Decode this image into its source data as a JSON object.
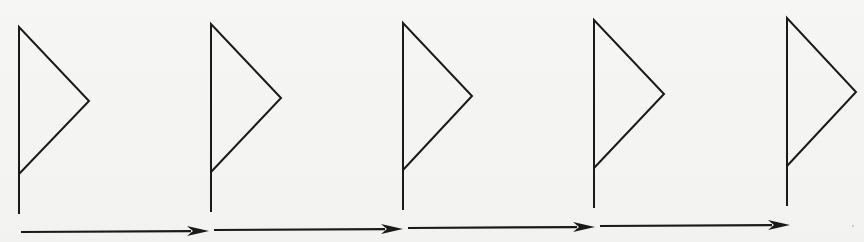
{
  "diagram": {
    "type": "sequence-of-flags",
    "stroke_color": "#1a1a1a",
    "background_color": "#f4f4f2",
    "flags": [
      {
        "id": "flag-1",
        "pole_x": 19,
        "top_y": 27,
        "tip_x": 89,
        "tip_y": 101,
        "junction_y": 174,
        "bottom_y": 214
      },
      {
        "id": "flag-2",
        "pole_x": 211,
        "top_y": 24,
        "tip_x": 281,
        "tip_y": 98,
        "junction_y": 172,
        "bottom_y": 212
      },
      {
        "id": "flag-3",
        "pole_x": 403,
        "top_y": 23,
        "tip_x": 472,
        "tip_y": 96,
        "junction_y": 170,
        "bottom_y": 210
      },
      {
        "id": "flag-4",
        "pole_x": 594,
        "top_y": 20,
        "tip_x": 664,
        "tip_y": 94,
        "junction_y": 168,
        "bottom_y": 208
      },
      {
        "id": "flag-5",
        "pole_x": 787,
        "top_y": 18,
        "tip_x": 856,
        "tip_y": 92,
        "junction_y": 166,
        "bottom_y": 206
      }
    ],
    "arrows": [
      {
        "id": "arrow-1",
        "from": "flag-1",
        "to": "flag-2",
        "x1": 21,
        "y1": 232,
        "x2": 209,
        "y2": 231
      },
      {
        "id": "arrow-2",
        "from": "flag-2",
        "to": "flag-3",
        "x1": 214,
        "y1": 230,
        "x2": 403,
        "y2": 229
      },
      {
        "id": "arrow-3",
        "from": "flag-3",
        "to": "flag-4",
        "x1": 408,
        "y1": 228,
        "x2": 595,
        "y2": 227
      },
      {
        "id": "arrow-4",
        "from": "flag-4",
        "to": "flag-5",
        "x1": 600,
        "y1": 226,
        "x2": 790,
        "y2": 225
      }
    ]
  }
}
